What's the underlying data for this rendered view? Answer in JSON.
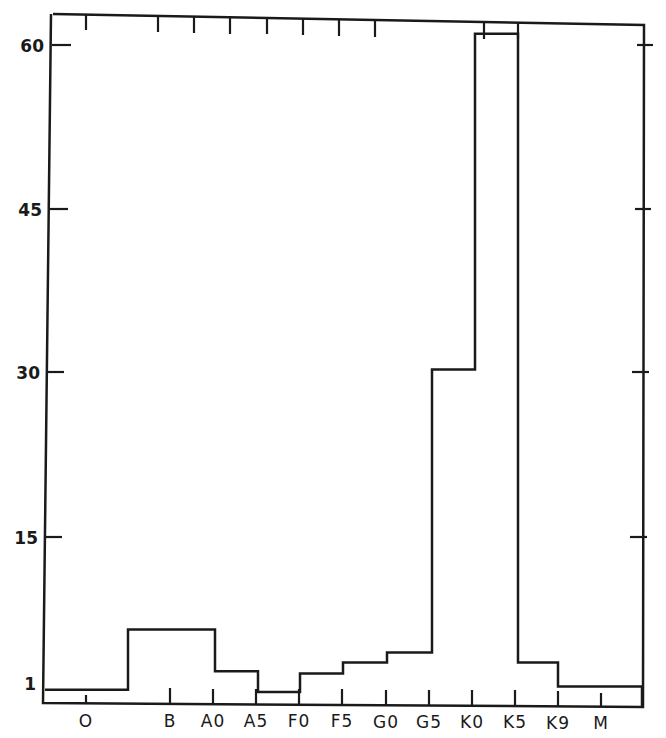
{
  "chart_data": {
    "type": "bar",
    "style": "step-histogram",
    "title": "",
    "xlabel": "",
    "ylabel": "",
    "x_tick_labels": [
      "O",
      "B",
      "A0",
      "A5",
      "F0",
      "F5",
      "G0",
      "G5",
      "K0",
      "K5",
      "K9",
      "M"
    ],
    "y_tick_labels": [
      "1",
      "15",
      "30",
      "45",
      "60"
    ],
    "y_ticks": [
      1,
      15,
      30,
      45,
      60
    ],
    "ylim": [
      0,
      63
    ],
    "grid": false,
    "legend": null,
    "bins": [
      {
        "from": "start",
        "to": "O-B",
        "value": 1.2
      },
      {
        "from": "O-B",
        "to": "A0",
        "value": 6.7
      },
      {
        "from": "A0",
        "to": "A5",
        "value": 2.9
      },
      {
        "from": "A5",
        "to": "F0",
        "value": 1.0
      },
      {
        "from": "F0",
        "to": "F5",
        "value": 2.7
      },
      {
        "from": "F5",
        "to": "G0",
        "value": 3.7
      },
      {
        "from": "G0",
        "to": "G5",
        "value": 4.6
      },
      {
        "from": "G5",
        "to": "K0+",
        "value": 30.4
      },
      {
        "from": "K0+",
        "to": "K5",
        "value": 61.0
      },
      {
        "from": "K5",
        "to": "K9",
        "value": 3.7
      },
      {
        "from": "K9",
        "to": "end",
        "value": 1.5
      }
    ],
    "categories": [
      "O",
      "B",
      "A0",
      "A5",
      "F0",
      "F5",
      "G0",
      "G5",
      "K0",
      "K5",
      "K9"
    ],
    "values": [
      1.2,
      6.7,
      2.9,
      1.0,
      2.7,
      3.7,
      4.6,
      30.4,
      61.0,
      3.7,
      1.5
    ]
  }
}
